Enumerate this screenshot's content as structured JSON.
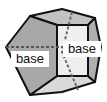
{
  "figure": {
    "name": "pentagonal-prism-base-diagram",
    "kind": "geometry-solid-diagram",
    "solid": "pentagonal prism",
    "background_color": "#ffffff",
    "labels": [
      {
        "id": "base-left",
        "text": "base",
        "x": 30,
        "y": 62
      },
      {
        "id": "base-right",
        "text": "base",
        "x": 82,
        "y": 52
      }
    ],
    "colors": {
      "outline": "#111111",
      "hidden_edge": "#555555",
      "face_left_base": "#a8a8a8",
      "face_front": "#eeeeee",
      "face_right_base": "#b0b0b0",
      "face_top": "#c2c2c2",
      "face_bottom": "#d8d8d8",
      "label_text": "#101010"
    },
    "geometry": {
      "left_base_pentagon": "6,47 30,16 57,25 57,76 30,95",
      "front_face": "57,25 88,25 88,76 57,76",
      "top_face": "30,16 62,9 95,18 88,25 57,25",
      "right_base_pentagon": "88,25 95,18 101,47 95,82 88,76",
      "bottom_face": "30,95 57,76 88,76 95,82 62,92",
      "hidden_center_line": "6,47 101,47",
      "hidden_right_edge": "72,12 62,52 78,90"
    },
    "edge_styles": {
      "visible": "solid",
      "hidden": "dashed",
      "dash_pattern": "3,2",
      "stroke_width": 2
    }
  }
}
